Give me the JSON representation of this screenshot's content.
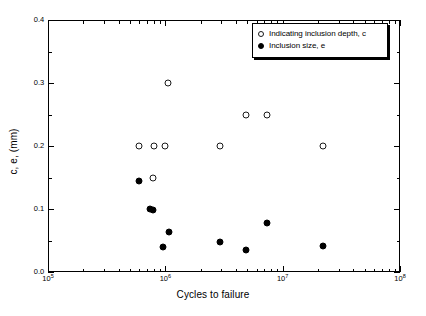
{
  "chart_data": {
    "type": "scatter",
    "title": "",
    "xlabel": "Cycles to failure",
    "ylabel": "c, e, (mm)",
    "xscale": "log",
    "yscale": "linear",
    "xlim": [
      100000,
      100000000
    ],
    "ylim": [
      0.0,
      0.4
    ],
    "grid": false,
    "legend_position": "top-right",
    "xticks": [
      {
        "value": 100000,
        "label": "10",
        "exp": "5"
      },
      {
        "value": 1000000,
        "label": "10",
        "exp": "6"
      },
      {
        "value": 10000000,
        "label": "10",
        "exp": "7"
      },
      {
        "value": 100000000,
        "label": "10",
        "exp": "8"
      }
    ],
    "yticks": [
      {
        "value": 0.0,
        "label": "0.0"
      },
      {
        "value": 0.1,
        "label": "0.1"
      },
      {
        "value": 0.2,
        "label": "0.2"
      },
      {
        "value": 0.3,
        "label": "0.3"
      },
      {
        "value": 0.4,
        "label": "0.4"
      }
    ],
    "series": [
      {
        "name": "Indicating inclusion depth, c",
        "marker": "open-circle",
        "color": "#000000",
        "points": [
          {
            "x": 600000,
            "y": 0.2
          },
          {
            "x": 780000,
            "y": 0.15
          },
          {
            "x": 800000,
            "y": 0.2
          },
          {
            "x": 1000000,
            "y": 0.2
          },
          {
            "x": 1050000,
            "y": 0.3
          },
          {
            "x": 2900000,
            "y": 0.2
          },
          {
            "x": 4900000,
            "y": 0.25
          },
          {
            "x": 7300000,
            "y": 0.25
          },
          {
            "x": 22000000.0,
            "y": 0.2
          }
        ]
      },
      {
        "name": "Inclusion size, e",
        "marker": "filled-circle",
        "color": "#000000",
        "points": [
          {
            "x": 600000,
            "y": 0.145
          },
          {
            "x": 740000,
            "y": 0.1
          },
          {
            "x": 790000,
            "y": 0.098
          },
          {
            "x": 960000,
            "y": 0.04
          },
          {
            "x": 1070000,
            "y": 0.063
          },
          {
            "x": 2900000,
            "y": 0.047
          },
          {
            "x": 4900000,
            "y": 0.035
          },
          {
            "x": 7300000,
            "y": 0.078
          },
          {
            "x": 22000000.0,
            "y": 0.042
          }
        ]
      }
    ],
    "legend": [
      {
        "label": "Indicating inclusion depth, c",
        "marker": "open-circle"
      },
      {
        "label": "Inclusion size, e",
        "marker": "filled-circle"
      }
    ]
  }
}
